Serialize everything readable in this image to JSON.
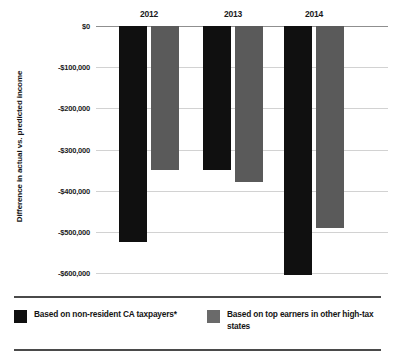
{
  "chart_data": {
    "type": "bar",
    "title": "",
    "subtitle": "",
    "xlabel": "",
    "ylabel": "Difference in actual vs. predicted income",
    "categories": [
      "2012",
      "2013",
      "2014"
    ],
    "series": [
      {
        "name": "Based on non-resident CA taxpayers*",
        "color": "#101010",
        "values": [
          -525000,
          -350000,
          -605000
        ]
      },
      {
        "name": "Based on top earners in other high-tax states",
        "color": "#5a5a5a",
        "values": [
          -350000,
          -380000,
          -490000
        ]
      }
    ],
    "ylim": [
      -600000,
      0
    ],
    "yticks": [
      0,
      -100000,
      -200000,
      -300000,
      -400000,
      -500000,
      -600000
    ],
    "ytick_labels": [
      "$0",
      "-$100,000",
      "-$200,000",
      "-$300,000",
      "-$400,000",
      "-$500,000",
      "-$600,000"
    ],
    "grid": true,
    "legend_position": "bottom"
  },
  "legend": {
    "entries": [
      {
        "label": "Based on non-resident CA taxpayers*",
        "swatch": "black-swatch"
      },
      {
        "label": "Based on top earners in other high-tax states",
        "swatch": "gray-swatch"
      }
    ]
  }
}
